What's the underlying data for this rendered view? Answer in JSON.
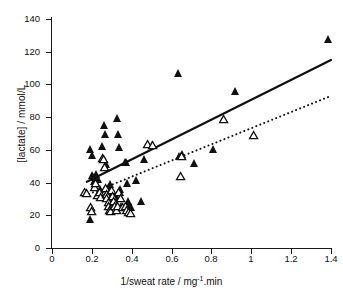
{
  "figure": {
    "caption": "",
    "background": "#ffffff",
    "ink": "#101010"
  },
  "chart_data": {
    "type": "scatter",
    "title": "",
    "xlabel": "1/sweat rate / mg-1.min",
    "xlabel_parts": {
      "pre": "1/sweat rate / mg",
      "sup": "-1",
      "post": ".min"
    },
    "ylabel": "[lactate] / mmol/L",
    "xlim": [
      0,
      1.4
    ],
    "ylim": [
      0,
      140
    ],
    "xticks": [
      0,
      0.2,
      0.4,
      0.6,
      0.8,
      1,
      1.2,
      1.4
    ],
    "xticklabels": [
      "0",
      "0.2",
      "0.4",
      "0.6",
      "0.8",
      "1",
      "1.2",
      "1.4"
    ],
    "yticks": [
      0,
      20,
      40,
      60,
      80,
      100,
      120,
      140
    ],
    "yticklabels": [
      "0",
      "20",
      "40",
      "60",
      "80",
      "100",
      "120",
      "140"
    ],
    "grid": false,
    "legend": null,
    "series": [
      {
        "name": "filled-triangles",
        "marker": "triangle-filled",
        "color": "#101010",
        "points": [
          [
            0.195,
            59.5
          ],
          [
            0.205,
            56.0
          ],
          [
            0.195,
            16.5
          ],
          [
            0.205,
            43.5
          ],
          [
            0.215,
            42.5
          ],
          [
            0.215,
            40.0
          ],
          [
            0.225,
            44.5
          ],
          [
            0.225,
            38.5
          ],
          [
            0.235,
            41.5
          ],
          [
            0.245,
            35.0
          ],
          [
            0.255,
            61.5
          ],
          [
            0.262,
            74.5
          ],
          [
            0.268,
            69.0
          ],
          [
            0.272,
            50.5
          ],
          [
            0.278,
            33.5
          ],
          [
            0.285,
            35.5
          ],
          [
            0.288,
            31.5
          ],
          [
            0.292,
            33.0
          ],
          [
            0.295,
            38.0
          ],
          [
            0.3,
            34.5
          ],
          [
            0.305,
            32.5
          ],
          [
            0.312,
            30.5
          ],
          [
            0.318,
            26.0
          ],
          [
            0.322,
            31.0
          ],
          [
            0.33,
            78.5
          ],
          [
            0.335,
            69.0
          ],
          [
            0.338,
            60.5
          ],
          [
            0.342,
            33.5
          ],
          [
            0.345,
            35.0
          ],
          [
            0.35,
            25.0
          ],
          [
            0.368,
            51.5
          ],
          [
            0.372,
            51.5
          ],
          [
            0.378,
            39.0
          ],
          [
            0.382,
            27.5
          ],
          [
            0.388,
            24.5
          ],
          [
            0.398,
            24.0
          ],
          [
            0.425,
            40.5
          ],
          [
            0.448,
            27.5
          ],
          [
            0.465,
            53.5
          ],
          [
            0.505,
            62.0
          ],
          [
            0.635,
            106.0
          ],
          [
            0.638,
            55.5
          ],
          [
            0.648,
            55.0
          ],
          [
            0.655,
            56.5
          ],
          [
            0.718,
            51.0
          ],
          [
            0.812,
            59.5
          ],
          [
            0.92,
            95.0
          ],
          [
            1.39,
            126.5
          ]
        ]
      },
      {
        "name": "open-triangles",
        "marker": "triangle-open",
        "color": "#101010",
        "points": [
          [
            0.165,
            33.5
          ],
          [
            0.175,
            32.5
          ],
          [
            0.192,
            24.0
          ],
          [
            0.198,
            21.5
          ],
          [
            0.212,
            36.5
          ],
          [
            0.218,
            38.5
          ],
          [
            0.228,
            31.5
          ],
          [
            0.238,
            33.5
          ],
          [
            0.245,
            30.5
          ],
          [
            0.252,
            54.0
          ],
          [
            0.258,
            53.5
          ],
          [
            0.262,
            48.5
          ],
          [
            0.268,
            35.5
          ],
          [
            0.272,
            32.0
          ],
          [
            0.275,
            29.5
          ],
          [
            0.282,
            27.0
          ],
          [
            0.285,
            24.5
          ],
          [
            0.288,
            22.5
          ],
          [
            0.292,
            21.5
          ],
          [
            0.298,
            34.5
          ],
          [
            0.302,
            31.0
          ],
          [
            0.308,
            28.0
          ],
          [
            0.315,
            24.5
          ],
          [
            0.322,
            22.0
          ],
          [
            0.328,
            25.0
          ],
          [
            0.335,
            33.5
          ],
          [
            0.345,
            29.5
          ],
          [
            0.352,
            24.0
          ],
          [
            0.368,
            25.0
          ],
          [
            0.375,
            22.0
          ],
          [
            0.382,
            21.0
          ],
          [
            0.392,
            20.5
          ],
          [
            0.478,
            62.5
          ],
          [
            0.505,
            62.0
          ],
          [
            0.645,
            43.0
          ],
          [
            0.648,
            55.5
          ],
          [
            0.862,
            78.0
          ],
          [
            1.012,
            68.0
          ]
        ]
      }
    ],
    "fits": [
      {
        "name": "solid-regression",
        "style": "solid",
        "color": "#101010",
        "width": 2.2,
        "x": [
          0.175,
          1.4
        ],
        "y": [
          40.5,
          115.0
        ]
      },
      {
        "name": "dotted-regression",
        "style": "dotted",
        "color": "#101010",
        "width": 2.0,
        "x": [
          0.165,
          1.4
        ],
        "y": [
          32.0,
          93.0
        ]
      }
    ]
  }
}
